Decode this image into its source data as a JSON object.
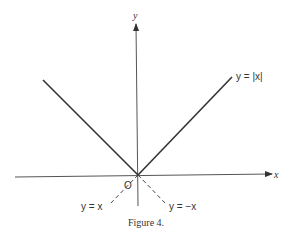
{
  "figure": {
    "caption": "Figure 4.",
    "axes": {
      "x_label": "x",
      "y_label": "y",
      "origin_label": "O"
    },
    "curves": [
      {
        "name": "abs",
        "label": "y = |x|",
        "style": "solid"
      },
      {
        "name": "identity-ext",
        "label": "y = x",
        "style": "dashed"
      },
      {
        "name": "negation-ext",
        "label": "y = −x",
        "style": "dashed"
      }
    ],
    "colors": {
      "line": "#333333",
      "background": "#ffffff"
    }
  }
}
